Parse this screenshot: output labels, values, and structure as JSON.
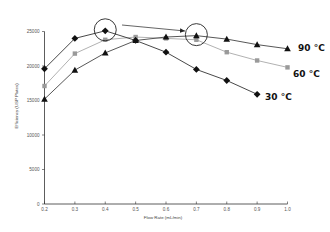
{
  "chart_data": {
    "type": "line",
    "title": "",
    "xlabel": "Flow Rate (mL/min)",
    "ylabel": "Efficiency (USP Plates)",
    "xlim": [
      0.2,
      1.0
    ],
    "ylim": [
      0,
      25000
    ],
    "x_ticks": [
      "0.2",
      "0.3",
      "0.4",
      "0.5",
      "0.6",
      "0.7",
      "0.8",
      "0.9",
      "1.0"
    ],
    "y_ticks": [
      "0",
      "5000",
      "10000",
      "15000",
      "20000",
      "25000"
    ],
    "grid": false,
    "legend_position": "inline-right",
    "series": [
      {
        "name": "30 °C",
        "marker": "diamond",
        "color": "#111111",
        "line_color": "#333333",
        "x": [
          0.2,
          0.3,
          0.4,
          0.5,
          0.6,
          0.7,
          0.8,
          0.9
        ],
        "values": [
          19600,
          24000,
          25100,
          23700,
          22000,
          19500,
          17900,
          15900
        ]
      },
      {
        "name": "60 °C",
        "marker": "square",
        "color": "#9a9a9a",
        "line_color": "#a8a8a8",
        "x": [
          0.2,
          0.3,
          0.4,
          0.5,
          0.6,
          0.7,
          0.8,
          0.9,
          1.0
        ],
        "values": [
          17100,
          21800,
          23800,
          24200,
          24000,
          23800,
          22000,
          20800,
          19800
        ]
      },
      {
        "name": "90 °C",
        "marker": "triangle",
        "color": "#111111",
        "line_color": "#444444",
        "x": [
          0.2,
          0.3,
          0.4,
          0.5,
          0.6,
          0.7,
          0.8,
          0.9,
          1.0
        ],
        "values": [
          15200,
          19400,
          21900,
          23700,
          24200,
          24400,
          23900,
          23100,
          22500
        ]
      }
    ],
    "annotations": [
      {
        "type": "circle",
        "x": 0.4,
        "y": 25100,
        "note": "30 °C optimum"
      },
      {
        "type": "circle",
        "x": 0.7,
        "y": 24400,
        "note": "90 °C optimum"
      },
      {
        "type": "arrow",
        "from": [
          0.4,
          25100
        ],
        "to": [
          0.7,
          24400
        ]
      }
    ]
  },
  "labels": {
    "series_90": "90 °C",
    "series_60": "60 °C",
    "series_30": "30 °C",
    "xlabel": "Flow Rate (mL/min)",
    "ylabel": "Efficiency (USP Plates)"
  }
}
